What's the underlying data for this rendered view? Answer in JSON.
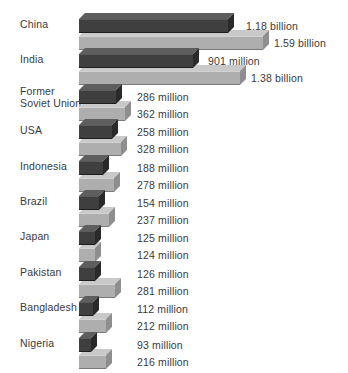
{
  "chart_data": {
    "type": "bar",
    "title": "",
    "subtitle": "",
    "xlabel": "",
    "ylabel": "",
    "orientation": "horizontal",
    "grid": false,
    "legend_position": "none",
    "axis_visible": false,
    "unit": "people",
    "categories": [
      "China",
      "India",
      "Former\nSoviet Union",
      "USA",
      "Indonesia",
      "Brazil",
      "Japan",
      "Pakistan",
      "Bangladesh",
      "Nigeria"
    ],
    "series": [
      {
        "name": "current",
        "color": "#3f3f3f",
        "values": [
          1180000000,
          901000000,
          286000000,
          258000000,
          188000000,
          154000000,
          125000000,
          126000000,
          112000000,
          93000000
        ],
        "labels": [
          "1.18 billion",
          "901 million",
          "286 million",
          "258 million",
          "188 million",
          "154 million",
          "125 million",
          "126 million",
          "112 million",
          "93 million"
        ]
      },
      {
        "name": "projected",
        "color": "#aeaeae",
        "values": [
          1590000000,
          1380000000,
          362000000,
          328000000,
          278000000,
          237000000,
          124000000,
          281000000,
          212000000,
          216000000
        ],
        "labels": [
          "1.59 billion",
          "1.38 billion",
          "362 million",
          "328 million",
          "278 million",
          "237 million",
          "124 million",
          "281 million",
          "212 million",
          "216 million"
        ]
      }
    ],
    "xlim": [
      0,
      1590000000
    ],
    "rows": [
      {
        "country": "China",
        "top": 13,
        "label_top": 19,
        "bars": [
          {
            "series": 0,
            "top": 0,
            "width": 149,
            "label": "1.18 billion",
            "label_left": 246,
            "label_top": 15
          },
          {
            "series": 1,
            "top": 17,
            "width": 184,
            "label": "1.59 billion",
            "label_left": 274,
            "label_top": 32
          }
        ]
      },
      {
        "country": "India",
        "top": 57,
        "label_top": 63,
        "bars": [
          {
            "series": 0,
            "top": 0,
            "width": 114,
            "label": "901 million",
            "label_left": 208,
            "label_top": 59
          },
          {
            "series": 1,
            "top": 17,
            "width": 161,
            "label": "1.38 billion",
            "label_left": 251,
            "label_top": 76
          }
        ]
      },
      {
        "country": "Former\nSoviet Union",
        "top": 96,
        "label_top": 96,
        "bars": [
          {
            "series": 0,
            "top": 0,
            "width": 37,
            "label": "286 million",
            "label_left": 137,
            "label_top": 98
          },
          {
            "series": 1,
            "top": 17,
            "width": 46,
            "label": "362 million",
            "label_top": 115,
            "label_left": 137
          }
        ]
      },
      {
        "country": "USA",
        "top": 135,
        "label_top": 141,
        "bars": [
          {
            "series": 0,
            "top": 0,
            "width": 33,
            "label": "258 million",
            "label_left": 137,
            "label_top": 137
          },
          {
            "series": 1,
            "top": 17,
            "width": 42,
            "label": "328 million",
            "label_left": 137,
            "label_top": 154
          }
        ]
      },
      {
        "country": "Indonesia",
        "top": 174,
        "label_top": 180,
        "bars": [
          {
            "series": 0,
            "top": 0,
            "width": 24,
            "label": "188 million",
            "label_left": 137,
            "label_top": 176
          },
          {
            "series": 1,
            "top": 17,
            "width": 35,
            "label": "278 million",
            "label_left": 137,
            "label_top": 193
          }
        ]
      },
      {
        "country": "Brazil",
        "top": 213,
        "label_top": 219,
        "bars": [
          {
            "series": 0,
            "top": 0,
            "width": 20,
            "label": "154 million",
            "label_left": 137,
            "label_top": 215
          },
          {
            "series": 1,
            "top": 17,
            "width": 30,
            "label": "237 million",
            "label_left": 137,
            "label_top": 232
          }
        ]
      },
      {
        "country": "Japan",
        "top": 252,
        "label_top": 258,
        "bars": [
          {
            "series": 0,
            "top": 0,
            "width": 16,
            "label": "125 million",
            "label_left": 137,
            "label_top": 254
          },
          {
            "series": 1,
            "top": 17,
            "width": 16,
            "label": "124 million",
            "label_left": 137,
            "label_top": 271
          }
        ]
      },
      {
        "country": "Pakistan",
        "top": 291,
        "label_top": 297,
        "bars": [
          {
            "series": 0,
            "top": 0,
            "width": 16,
            "label": "126 million",
            "label_left": 137,
            "label_top": 293
          },
          {
            "series": 1,
            "top": 17,
            "width": 36,
            "label": "281 million",
            "label_left": 137,
            "label_top": 310
          }
        ]
      },
      {
        "country": "Bangladesh",
        "top": 330,
        "label_top": 336,
        "bars": [
          {
            "series": 0,
            "top": 0,
            "width": 14,
            "label": "112 million",
            "label_left": 137,
            "label_top": 332
          },
          {
            "series": 1,
            "top": 17,
            "width": 27,
            "label": "212 million",
            "label_left": 137,
            "label_top": 349
          }
        ]
      },
      {
        "country": "Nigeria",
        "top": 369,
        "label_top": 375,
        "bars": [
          {
            "series": 0,
            "top": 0,
            "width": 12,
            "label": "93 million",
            "label_left": 137,
            "label_top": 371
          },
          {
            "series": 1,
            "top": 17,
            "width": 27,
            "label": "216 million",
            "label_left": 137,
            "label_top": 388
          }
        ]
      }
    ]
  }
}
